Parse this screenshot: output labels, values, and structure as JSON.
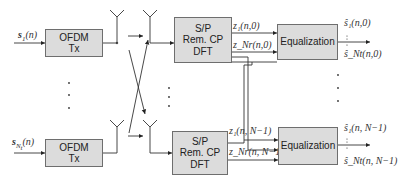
{
  "tx": {
    "top": {
      "input": "s",
      "input_sub": "1",
      "input_arg": "(n)",
      "line1": "OFDM",
      "line2": "Tx"
    },
    "bottom": {
      "input": "s",
      "input_sub": "N",
      "input_subsub": "t",
      "input_arg": "(n)",
      "line1": "OFDM",
      "line2": "Tx"
    }
  },
  "rx": {
    "top": {
      "line1": "S/P",
      "line2": "Rem. CP",
      "line3": "DFT"
    },
    "bottom": {
      "line1": "S/P",
      "line2": "Rem. CP",
      "line3": "DFT"
    }
  },
  "signals": {
    "z1_0": "z₁(n,0)",
    "zNr_0": "z_Nr(n,0)",
    "z1_N1": "z₁(n, N−1)",
    "zNr_N1": "z_Nr(n, N−1)"
  },
  "equalizer": {
    "top": {
      "label": "Equalization"
    },
    "bottom": {
      "label": "Equalization"
    }
  },
  "outputs": {
    "top_first": "ŝ₁(n,0)",
    "top_last": "ŝ_Nt(n,0)",
    "bottom_first": "ŝ₁(n, N−1)",
    "bottom_last": "ŝ_Nt(n, N−1)"
  },
  "colors": {
    "box_fill": "#dcdcdc",
    "line": "#333333"
  }
}
